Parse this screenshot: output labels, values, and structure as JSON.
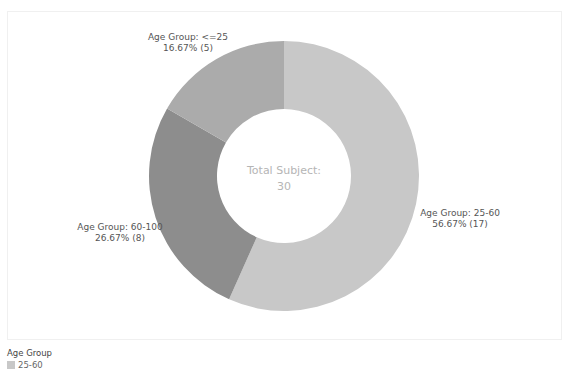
{
  "chart_data": {
    "type": "pie",
    "variant": "donut",
    "title": "",
    "center_label": {
      "line1": "Total Subject:",
      "line2": "30"
    },
    "total": 30,
    "slices": [
      {
        "category": "25-60",
        "label": "Age Group: 25-60",
        "count": 17,
        "percent": 56.67,
        "percent_text": "56.67% (17)",
        "color": "#c8c8c8"
      },
      {
        "category": "60-100",
        "label": "Age Group: 60-100",
        "count": 8,
        "percent": 26.67,
        "percent_text": "26.67% (8)",
        "color": "#8d8d8d"
      },
      {
        "category": "<=25",
        "label": "Age Group: <=25",
        "count": 5,
        "percent": 16.67,
        "percent_text": "16.67% (5)",
        "color": "#ababab"
      }
    ],
    "start": "12 o'clock",
    "direction": "clockwise",
    "legend_placement": "bottom-left"
  },
  "legend": {
    "title": "Age Group",
    "items": [
      {
        "label": "25-60",
        "color": "#c8c8c8"
      }
    ]
  }
}
